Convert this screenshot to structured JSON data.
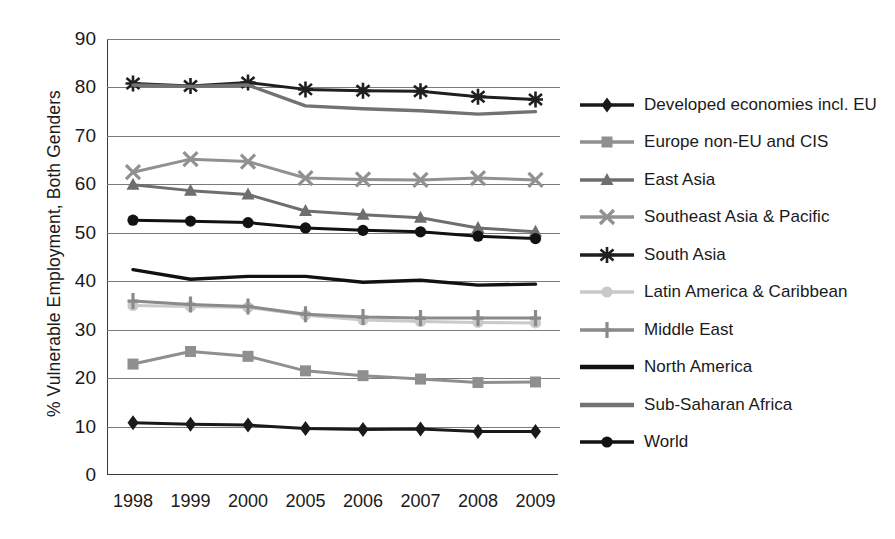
{
  "chart_data": {
    "type": "line",
    "title": "",
    "xlabel": "",
    "ylabel": "% Vulnerable Employment, Both Genders",
    "categories": [
      "1998",
      "1999",
      "2000",
      "2005",
      "2006",
      "2007",
      "2008",
      "2009"
    ],
    "ylim": [
      0,
      90
    ],
    "ytick_labels": [
      "0",
      "10",
      "20",
      "30",
      "40",
      "50",
      "60",
      "70",
      "80",
      "90"
    ],
    "ytick_values": [
      0,
      10,
      20,
      30,
      40,
      50,
      60,
      70,
      80,
      90
    ],
    "grid": true,
    "legend_position": "right",
    "series": [
      {
        "name": "Developed economies incl. EU",
        "marker": "diamond",
        "color": "#1a1a1a",
        "values": [
          10.8,
          10.5,
          10.3,
          9.6,
          9.4,
          9.5,
          9.0,
          9.0
        ]
      },
      {
        "name": "Europe non-EU and CIS",
        "marker": "square",
        "color": "#8f8f8f",
        "values": [
          22.9,
          25.5,
          24.5,
          21.5,
          20.5,
          19.8,
          19.1,
          19.2
        ]
      },
      {
        "name": "East Asia",
        "marker": "triangle",
        "color": "#6e6e6e",
        "values": [
          59.9,
          58.7,
          57.9,
          54.5,
          53.7,
          53.1,
          51.0,
          50.2
        ]
      },
      {
        "name": "Southeast Asia & Pacific",
        "marker": "x",
        "color": "#919191",
        "values": [
          62.5,
          65.2,
          64.7,
          61.3,
          61.0,
          60.9,
          61.3,
          60.9
        ]
      },
      {
        "name": "South Asia",
        "marker": "asterisk",
        "color": "#1f1f1f",
        "values": [
          80.8,
          80.3,
          81.0,
          79.6,
          79.3,
          79.2,
          78.1,
          77.5
        ]
      },
      {
        "name": "Latin America & Caribbean",
        "marker": "circle-light",
        "color": "#c9c9c9",
        "values": [
          35.0,
          34.8,
          34.6,
          33.0,
          32.0,
          31.7,
          31.5,
          31.4
        ]
      },
      {
        "name": "Middle East",
        "marker": "plus",
        "color": "#8a8a8a",
        "values": [
          35.9,
          35.2,
          34.8,
          33.2,
          32.6,
          32.4,
          32.4,
          32.4
        ]
      },
      {
        "name": "North America",
        "marker": "none",
        "color": "#111111",
        "values": [
          42.4,
          40.4,
          41.0,
          41.0,
          39.8,
          40.2,
          39.2,
          39.4
        ]
      },
      {
        "name": "Sub-Saharan Africa",
        "marker": "none",
        "color": "#727272",
        "values": [
          80.5,
          80.2,
          80.5,
          76.2,
          75.6,
          75.2,
          74.5,
          75.0
        ]
      },
      {
        "name": "World",
        "marker": "circle",
        "color": "#121212",
        "values": [
          52.6,
          52.4,
          52.1,
          51.0,
          50.5,
          50.2,
          49.3,
          48.8
        ]
      }
    ]
  }
}
